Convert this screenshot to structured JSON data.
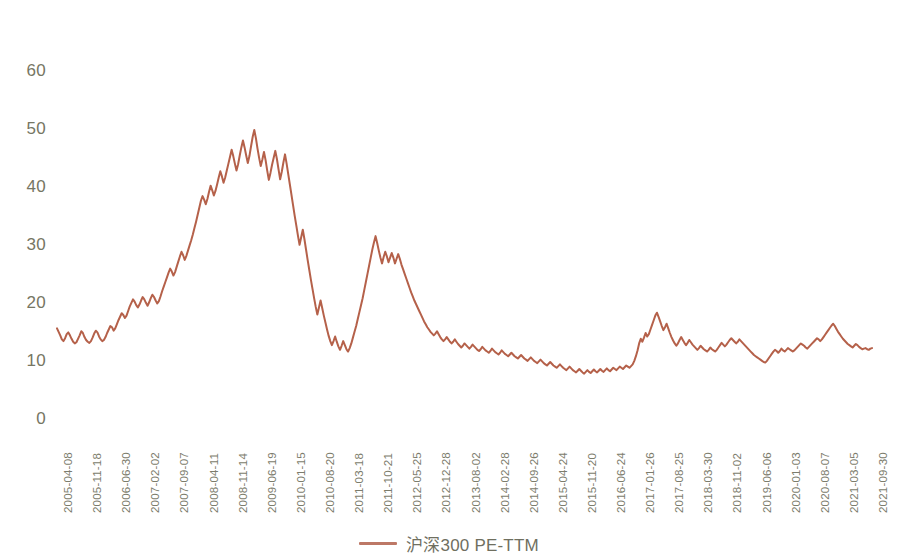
{
  "chart_data": {
    "type": "line",
    "title": "",
    "subtitle": "",
    "xlabel": "",
    "ylabel": "",
    "grid": false,
    "legend_position": "bottom-center",
    "line_color": "#b5614a",
    "line_width": 2,
    "ylim": [
      0,
      60
    ],
    "yticks": [
      0,
      10,
      20,
      30,
      40,
      50,
      60
    ],
    "ytick_labels": [
      "0",
      "10",
      "20",
      "30",
      "40",
      "50",
      "60"
    ],
    "xtick_labels": [
      "2005-04-08",
      "2005-11-18",
      "2006-06-30",
      "2007-02-02",
      "2007-09-07",
      "2008-04-11",
      "2008-11-14",
      "2009-06-19",
      "2010-01-15",
      "2010-08-20",
      "2011-03-18",
      "2011-10-21",
      "2012-05-25",
      "2012-12-28",
      "2013-08-02",
      "2014-02-28",
      "2014-09-26",
      "2015-04-24",
      "2015-11-20",
      "2016-06-24",
      "2017-01-26",
      "2017-08-25",
      "2018-03-30",
      "2018-11-02",
      "2019-06-06",
      "2020-01-03",
      "2020-08-07",
      "2021-03-05",
      "2021-09-30"
    ],
    "series": [
      {
        "name": "沪深300 PE-TTM",
        "color": "#b5614a",
        "values": [
          15.8,
          15.2,
          14.6,
          13.9,
          13.6,
          14.1,
          14.8,
          15.1,
          14.6,
          14.0,
          13.5,
          13.2,
          13.4,
          14.0,
          14.6,
          15.3,
          15.0,
          14.3,
          13.8,
          13.5,
          13.3,
          13.6,
          14.2,
          14.9,
          15.4,
          15.1,
          14.4,
          13.9,
          13.6,
          13.8,
          14.3,
          15.0,
          15.6,
          16.2,
          16.0,
          15.4,
          15.8,
          16.5,
          17.2,
          17.8,
          18.4,
          18.1,
          17.6,
          18.0,
          18.8,
          19.6,
          20.2,
          20.8,
          20.4,
          19.8,
          19.4,
          19.9,
          20.6,
          21.2,
          20.8,
          20.2,
          19.7,
          20.3,
          21.0,
          21.6,
          21.2,
          20.6,
          20.1,
          20.5,
          21.3,
          22.2,
          23.0,
          23.8,
          24.6,
          25.4,
          26.1,
          25.6,
          24.9,
          25.5,
          26.4,
          27.3,
          28.2,
          29.0,
          28.4,
          27.6,
          28.3,
          29.2,
          30.1,
          31.0,
          32.0,
          33.1,
          34.2,
          35.4,
          36.6,
          37.8,
          38.6,
          38.0,
          37.2,
          38.1,
          39.3,
          40.4,
          39.6,
          38.7,
          39.5,
          40.6,
          41.8,
          42.9,
          42.0,
          40.9,
          41.8,
          43.0,
          44.2,
          45.4,
          46.6,
          45.5,
          44.2,
          43.0,
          44.1,
          45.6,
          47.0,
          48.2,
          47.0,
          45.6,
          44.3,
          45.5,
          47.2,
          48.8,
          50.0,
          48.6,
          46.8,
          45.2,
          43.8,
          44.9,
          46.2,
          44.8,
          43.0,
          41.4,
          42.6,
          44.0,
          45.2,
          46.4,
          45.0,
          43.2,
          41.5,
          42.8,
          44.4,
          45.8,
          44.2,
          42.4,
          40.6,
          38.8,
          37.0,
          35.2,
          33.5,
          31.8,
          30.2,
          31.5,
          32.8,
          31.2,
          29.4,
          27.6,
          25.9,
          24.2,
          22.6,
          21.0,
          19.5,
          18.2,
          19.4,
          20.6,
          19.3,
          18.0,
          16.8,
          15.6,
          14.5,
          13.6,
          12.9,
          13.6,
          14.4,
          13.5,
          12.7,
          12.1,
          12.8,
          13.6,
          12.9,
          12.2,
          11.8,
          12.4,
          13.2,
          14.2,
          15.2,
          16.2,
          17.4,
          18.6,
          19.8,
          21.0,
          22.4,
          23.8,
          25.2,
          26.6,
          28.0,
          29.4,
          30.6,
          31.7,
          30.5,
          29.2,
          28.0,
          27.0,
          28.1,
          29.0,
          28.2,
          27.2,
          28.0,
          28.8,
          28.0,
          27.0,
          27.8,
          28.6,
          27.8,
          26.8,
          26.0,
          25.2,
          24.4,
          23.6,
          22.8,
          22.0,
          21.3,
          20.6,
          20.0,
          19.4,
          18.8,
          18.2,
          17.6,
          17.0,
          16.5,
          16.0,
          15.6,
          15.2,
          14.9,
          14.6,
          14.9,
          15.3,
          14.8,
          14.3,
          13.9,
          13.6,
          13.9,
          14.3,
          13.9,
          13.5,
          13.2,
          13.5,
          13.9,
          13.5,
          13.1,
          12.8,
          12.5,
          12.8,
          13.2,
          12.9,
          12.6,
          12.3,
          12.6,
          13.0,
          12.7,
          12.4,
          12.1,
          11.9,
          12.2,
          12.6,
          12.3,
          12.0,
          11.8,
          11.6,
          11.9,
          12.3,
          12.0,
          11.7,
          11.5,
          11.3,
          11.6,
          12.0,
          11.7,
          11.4,
          11.2,
          11.0,
          11.3,
          11.6,
          11.3,
          11.0,
          10.8,
          10.6,
          10.9,
          11.2,
          10.9,
          10.6,
          10.4,
          10.2,
          10.5,
          10.8,
          10.5,
          10.2,
          10.0,
          9.8,
          10.1,
          10.4,
          10.1,
          9.8,
          9.6,
          9.4,
          9.7,
          10.0,
          9.7,
          9.4,
          9.2,
          9.0,
          9.3,
          9.6,
          9.3,
          9.0,
          8.8,
          8.6,
          8.9,
          9.2,
          8.9,
          8.6,
          8.4,
          8.2,
          8.5,
          8.8,
          8.5,
          8.2,
          8.0,
          8.3,
          8.6,
          8.3,
          8.1,
          8.4,
          8.7,
          8.4,
          8.2,
          8.5,
          8.8,
          8.5,
          8.3,
          8.6,
          8.9,
          8.6,
          8.4,
          8.7,
          9.0,
          8.8,
          8.6,
          8.9,
          9.2,
          9.0,
          8.8,
          9.1,
          9.4,
          9.2,
          9.0,
          9.3,
          9.6,
          10.2,
          11.0,
          12.0,
          13.2,
          14.0,
          13.5,
          14.2,
          15.0,
          14.4,
          14.8,
          15.6,
          16.4,
          17.2,
          18.0,
          18.5,
          17.8,
          17.0,
          16.2,
          15.5,
          16.0,
          16.6,
          15.8,
          15.0,
          14.3,
          13.7,
          13.2,
          12.8,
          13.2,
          13.8,
          14.3,
          13.8,
          13.3,
          12.9,
          13.3,
          13.8,
          13.4,
          13.0,
          12.7,
          12.4,
          12.1,
          12.4,
          12.8,
          12.5,
          12.2,
          12.0,
          11.8,
          12.1,
          12.5,
          12.2,
          12.0,
          11.8,
          12.1,
          12.5,
          12.9,
          13.3,
          13.0,
          12.7,
          13.0,
          13.4,
          13.8,
          14.1,
          13.8,
          13.5,
          13.2,
          13.5,
          13.9,
          13.6,
          13.3,
          13.0,
          12.7,
          12.4,
          12.1,
          11.8,
          11.5,
          11.2,
          11.0,
          10.8,
          10.6,
          10.4,
          10.2,
          10.0,
          9.9,
          10.2,
          10.6,
          11.0,
          11.4,
          11.8,
          12.1,
          11.9,
          11.6,
          11.9,
          12.3,
          12.0,
          11.8,
          12.1,
          12.4,
          12.2,
          12.0,
          11.8,
          12.0,
          12.3,
          12.6,
          12.9,
          13.2,
          13.0,
          12.8,
          12.5,
          12.3,
          12.6,
          12.9,
          13.2,
          13.5,
          13.8,
          14.1,
          13.9,
          13.6,
          13.9,
          14.3,
          14.7,
          15.1,
          15.5,
          15.9,
          16.3,
          16.6,
          16.2,
          15.7,
          15.2,
          14.8,
          14.4,
          14.0,
          13.7,
          13.4,
          13.1,
          12.9,
          12.7,
          12.5,
          12.8,
          13.1,
          12.9,
          12.6,
          12.4,
          12.2,
          12.3,
          12.4,
          12.2,
          12.1,
          12.3,
          12.4
        ]
      }
    ]
  },
  "legend": {
    "label": "沪深300 PE-TTM",
    "swatch_color": "#bd7866"
  },
  "axes": {
    "y_tick_color": "#767663",
    "x_tick_color": "#7c7c6c"
  }
}
